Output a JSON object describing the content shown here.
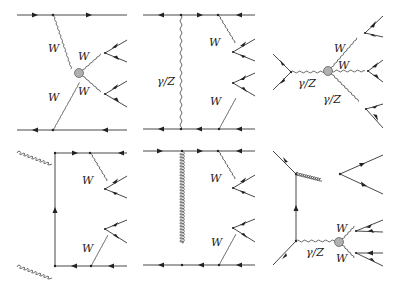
{
  "diagrams": [
    {
      "id": "d1",
      "labels": [
        "W",
        "W",
        "W",
        "W"
      ],
      "description": "t-channel vector boson scattering with quartic vertex"
    },
    {
      "id": "d2",
      "labels": [
        "γ/Z",
        "W",
        "W"
      ],
      "description": "t-channel photon/Z exchange with W emission from quark lines"
    },
    {
      "id": "d3",
      "labels": [
        "γ/Z",
        "W",
        "W",
        "γ/Z"
      ],
      "description": "s-channel photon/Z with quartic vertex to W W γ/Z"
    },
    {
      "id": "d4",
      "labels": [
        "W",
        "W"
      ],
      "description": "gluon-gluon fusion quark box with W emission"
    },
    {
      "id": "d5",
      "labels": [
        "W",
        "W"
      ],
      "description": "t-channel gluon exchange with W emission"
    },
    {
      "id": "d6",
      "labels": [
        "W",
        "W",
        "γ/Z"
      ],
      "description": "qq̄ with gluon emission and γ/Z to WW"
    }
  ],
  "colors": {
    "line": "#333333",
    "blob": "#b0b0b0"
  }
}
